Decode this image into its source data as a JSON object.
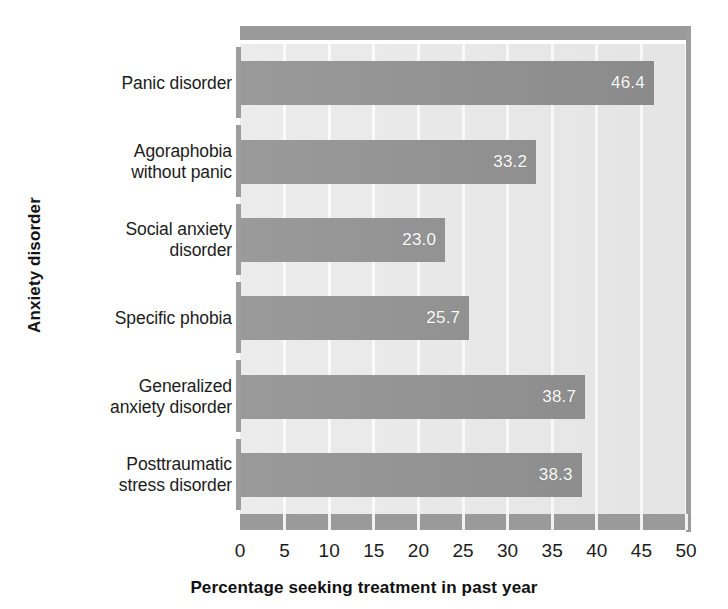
{
  "chart_data": {
    "type": "bar",
    "orientation": "horizontal",
    "title": "",
    "xlabel": "Percentage seeking treatment in past year",
    "ylabel": "Anxiety disorder",
    "xlim": [
      0,
      50
    ],
    "xticks": [
      0,
      5,
      10,
      15,
      20,
      25,
      30,
      35,
      40,
      45,
      50
    ],
    "xtick_labels": [
      "0",
      "5",
      "10",
      "15",
      "20",
      "25",
      "30",
      "35",
      "40",
      "45",
      "50"
    ],
    "grid": true,
    "grid_axis": "x",
    "legend": false,
    "legend_position": "none",
    "categories": [
      "Panic disorder",
      "Agoraphobia without panic",
      "Social anxiety disorder",
      "Specific phobia",
      "Generalized anxiety disorder",
      "Posttraumatic stress disorder"
    ],
    "category_label_lines": [
      [
        "Panic disorder"
      ],
      [
        "Agoraphobia",
        "without panic"
      ],
      [
        "Social anxiety",
        "disorder"
      ],
      [
        "Specific phobia"
      ],
      [
        "Generalized",
        "anxiety disorder"
      ],
      [
        "Posttraumatic",
        "stress disorder"
      ]
    ],
    "values": [
      46.4,
      33.2,
      23.0,
      25.7,
      38.7,
      38.3
    ],
    "value_labels": [
      "46.4",
      "33.2",
      "23.0",
      "25.7",
      "38.7",
      "38.3"
    ],
    "colors": {
      "bar": "#8c8c8c",
      "plot_background": "#e9e9e9",
      "gridline": "#fbfbfb",
      "axis_band": "#9a9a9a",
      "value_label": "#ffffff",
      "text": "#1a1a1a",
      "page_background": "#ffffff"
    }
  }
}
